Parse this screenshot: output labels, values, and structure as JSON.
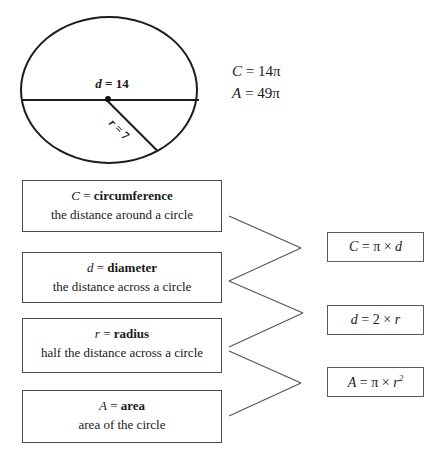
{
  "figure": {
    "shape": "circle",
    "diameter_label": {
      "var": "d",
      "eq": " = ",
      "value": "14"
    },
    "radius_label": {
      "var": "r",
      "eq": " = ",
      "value": "7"
    }
  },
  "given_values": [
    {
      "var": "C",
      "eq": " = ",
      "value": "14",
      "unit": "π"
    },
    {
      "var": "A",
      "eq": " = ",
      "value": "49",
      "unit": "π"
    }
  ],
  "definitions": [
    {
      "symbol": "C",
      "eq": " = ",
      "term": "circumference",
      "description": "the distance around a circle"
    },
    {
      "symbol": "d",
      "eq": " = ",
      "term": "diameter",
      "description": "the distance across a circle"
    },
    {
      "symbol": "r",
      "eq": " = ",
      "term": "radius",
      "description": "half the distance across a circle"
    },
    {
      "symbol": "A",
      "eq": " = ",
      "term": "area",
      "description": "area of the circle"
    }
  ],
  "formulas": [
    {
      "lhs": "C",
      "eq": " = ",
      "rhs_pi": "π",
      "op": " × ",
      "rhs_var": "d",
      "exponent": ""
    },
    {
      "lhs": "d",
      "eq": " = ",
      "rhs_pi": "2",
      "op": " × ",
      "rhs_var": "r",
      "exponent": ""
    },
    {
      "lhs": "A",
      "eq": " = ",
      "rhs_pi": "π",
      "op": " × ",
      "rhs_var": "r",
      "exponent": "2"
    }
  ],
  "colors": {
    "ink": "#1a1a1a",
    "box_border": "#4a4a4a",
    "connector": "#555555",
    "background": "#ffffff"
  }
}
